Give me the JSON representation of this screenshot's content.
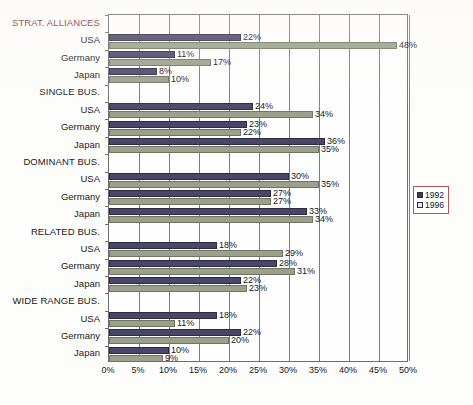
{
  "chart_data": {
    "type": "bar",
    "orientation": "horizontal",
    "title": "",
    "xlabel": "",
    "ylabel": "",
    "xlim": [
      0,
      50
    ],
    "grid": true,
    "legend_position": "right",
    "value_suffix": "%",
    "tick_labels": [
      "0%",
      "5%",
      "10%",
      "15%",
      "20%",
      "25%",
      "30%",
      "35%",
      "40%",
      "45%",
      "50%"
    ],
    "tick_values": [
      0,
      5,
      10,
      15,
      20,
      25,
      30,
      35,
      40,
      45,
      50
    ],
    "series": [
      {
        "name": "1992",
        "color": "#4a4668"
      },
      {
        "name": "1996",
        "color": "#9aa08c"
      }
    ],
    "groups": [
      {
        "label": "STRAT. ALLIANCES",
        "is_section": true,
        "accent": true,
        "rows": [
          {
            "label": "USA",
            "v1992": 22,
            "v1996": 48,
            "t1992": "22%",
            "t1996": "48%"
          },
          {
            "label": "Germany",
            "v1992": 11,
            "v1996": 17,
            "t1992": "11%",
            "t1996": "17%"
          },
          {
            "label": "Japan",
            "v1992": 8,
            "v1996": 10,
            "t1992": "8%",
            "t1996": "10%"
          }
        ]
      },
      {
        "label": "SINGLE BUS.",
        "is_section": true,
        "accent": false,
        "rows": [
          {
            "label": "USA",
            "v1992": 24,
            "v1996": 34,
            "t1992": "24%",
            "t1996": "34%"
          },
          {
            "label": "Germany",
            "v1992": 23,
            "v1996": 22,
            "t1992": "23%",
            "t1996": "22%"
          },
          {
            "label": "Japan",
            "v1992": 36,
            "v1996": 35,
            "t1992": "36%",
            "t1996": "35%"
          }
        ]
      },
      {
        "label": "DOMINANT BUS.",
        "is_section": true,
        "accent": false,
        "rows": [
          {
            "label": "USA",
            "v1992": 30,
            "v1996": 35,
            "t1992": "30%",
            "t1996": "35%"
          },
          {
            "label": "Germany",
            "v1992": 27,
            "v1996": 27,
            "t1992": "27%",
            "t1996": "27%"
          },
          {
            "label": "Japan",
            "v1992": 33,
            "v1996": 34,
            "t1992": "33%",
            "t1996": "34%"
          }
        ]
      },
      {
        "label": "RELATED BUS.",
        "is_section": true,
        "accent": false,
        "rows": [
          {
            "label": "USA",
            "v1992": 18,
            "v1996": 29,
            "t1992": "18%",
            "t1996": "29%"
          },
          {
            "label": "Germany",
            "v1992": 28,
            "v1996": 31,
            "t1992": "28%",
            "t1996": "31%"
          },
          {
            "label": "Japan",
            "v1992": 22,
            "v1996": 23,
            "t1992": "22%",
            "t1996": "23%"
          }
        ]
      },
      {
        "label": "WIDE RANGE BUS.",
        "is_section": true,
        "accent": false,
        "rows": [
          {
            "label": "USA",
            "v1992": 18,
            "v1996": 11,
            "t1992": "18%",
            "t1996": "11%"
          },
          {
            "label": "Germany",
            "v1992": 22,
            "v1996": 20,
            "t1992": "22%",
            "t1996": "20%"
          },
          {
            "label": "Japan",
            "v1992": 10,
            "v1996": 9,
            "t1992": "10%",
            "t1996": "9%"
          }
        ]
      }
    ]
  },
  "legend": {
    "items": [
      {
        "label": "1992"
      },
      {
        "label": "1996"
      }
    ]
  }
}
